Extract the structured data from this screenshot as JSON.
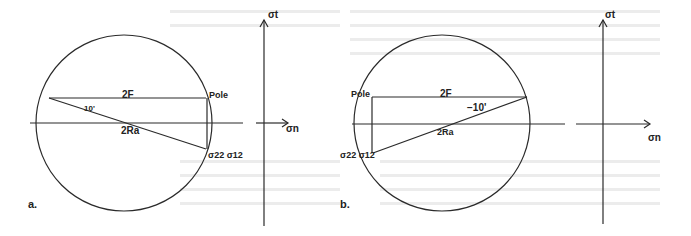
{
  "figure": {
    "panels": [
      {
        "id": "a",
        "panel_label": "a.",
        "chord_label": "2F",
        "diameter_label": "2Ra",
        "angle_label": "10'",
        "pole_label": "Pole",
        "point_label": "σ22 σ12",
        "axis_vertical_label": "σt",
        "axis_horizontal_label": "σn"
      },
      {
        "id": "b",
        "panel_label": "b.",
        "chord_label": "2F",
        "diameter_label": "2Ra",
        "angle_label": "−10'",
        "pole_label": "Pole",
        "point_label": "σ22 σ12",
        "axis_vertical_label": "σt",
        "axis_horizontal_label": "σn"
      }
    ]
  }
}
